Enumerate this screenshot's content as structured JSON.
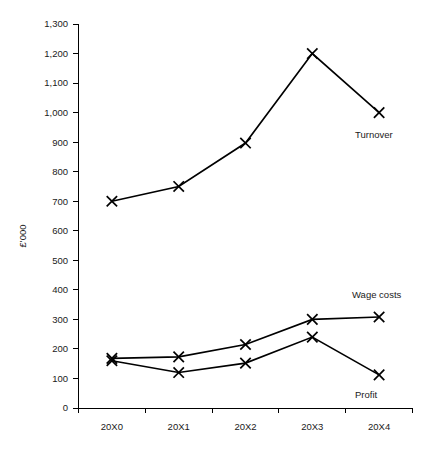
{
  "chart_data": {
    "type": "line",
    "title": "",
    "xlabel": "",
    "ylabel": "£'000",
    "categories": [
      "20X0",
      "20X1",
      "20X2",
      "20X3",
      "20X4"
    ],
    "ylim": [
      0,
      1300
    ],
    "y_ticks": [
      "0",
      "100",
      "200",
      "300",
      "400",
      "500",
      "600",
      "700",
      "800",
      "900",
      "1,000",
      "1,100",
      "1,200",
      "1,300"
    ],
    "y_tick_values": [
      0,
      100,
      200,
      300,
      400,
      500,
      600,
      700,
      800,
      900,
      1000,
      1100,
      1200,
      1300
    ],
    "grid": false,
    "legend_position": "inline-annotations",
    "marker": "x",
    "series": [
      {
        "name": "Turnover",
        "values": [
          700,
          750,
          897,
          1200,
          1000
        ],
        "label": "Turnover",
        "label_x": 355,
        "label_y": 138
      },
      {
        "name": "Wage costs",
        "values": [
          168,
          173,
          215,
          300,
          308
        ],
        "label": "Wage costs",
        "label_x": 352,
        "label_y": 298
      },
      {
        "name": "Profit",
        "values": [
          160,
          120,
          152,
          240,
          112
        ],
        "label": "Profit",
        "label_x": 355,
        "label_y": 398
      }
    ]
  },
  "axes": {
    "y_axis_title": "£'000",
    "x_tick_labels": [
      "20X0",
      "20X1",
      "20X2",
      "20X3",
      "20X4"
    ],
    "y_tick_labels": [
      "1,300",
      "1,200",
      "1,100",
      "1,000",
      "900",
      "800",
      "700",
      "600",
      "500",
      "400",
      "300",
      "200",
      "100",
      "0"
    ]
  },
  "annotations": {
    "turnover": "Turnover",
    "wage_costs": "Wage costs",
    "profit": "Profit"
  },
  "colors": {
    "line": "#000000",
    "text": "#1a1a1a",
    "background": "#ffffff"
  }
}
